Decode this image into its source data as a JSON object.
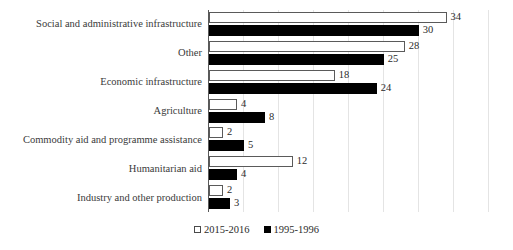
{
  "chart_data": {
    "type": "bar",
    "orientation": "horizontal",
    "title": "",
    "subtitle": "",
    "xlabel": "",
    "ylabel": "",
    "xlim": [
      0,
      42.5
    ],
    "grid": true,
    "grid_step": 5,
    "legend_position": "bottom-center",
    "categories": [
      "Social and administrative infrastructure",
      "Other",
      "Economic infrastructure",
      "Agriculture",
      "Commodity aid and programme assistance",
      "Humanitarian aid",
      "Industry and other production"
    ],
    "series": [
      {
        "name": "2015-2016",
        "style": "open",
        "color": "#ffffff",
        "border_color": "#5a5a5a",
        "values": [
          34,
          28,
          18,
          4,
          2,
          12,
          2
        ]
      },
      {
        "name": "1995-1996",
        "style": "solid",
        "color": "#000000",
        "border_color": "#000000",
        "values": [
          30,
          25,
          24,
          8,
          5,
          4,
          3
        ]
      }
    ],
    "data_labels": {
      "2015-2016": [
        "34",
        "28",
        "18",
        "4",
        "2",
        "12",
        "2"
      ],
      "1995-1996": [
        "30",
        "25",
        "24",
        "8",
        "5",
        "4",
        "3"
      ]
    }
  },
  "legend": {
    "items": [
      {
        "label": "2015-2016"
      },
      {
        "label": "1995-1996"
      }
    ]
  }
}
